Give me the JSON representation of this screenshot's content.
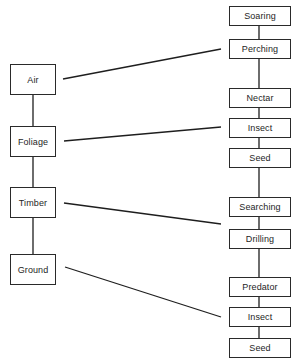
{
  "diagram": {
    "colors": {
      "line": "#1e1e1e",
      "box_border": "#2a2a2a",
      "background": "#ffffff"
    },
    "habitats": [
      {
        "label": "Air",
        "top": 64
      },
      {
        "label": "Foliage",
        "top": 126
      },
      {
        "label": "Timber",
        "top": 187
      },
      {
        "label": "Ground",
        "top": 254
      }
    ],
    "behaviours": [
      {
        "label": "Soaring",
        "top": 6
      },
      {
        "label": "Perching",
        "top": 39
      },
      {
        "label": "Nectar",
        "top": 88
      },
      {
        "label": "Insect",
        "top": 118
      },
      {
        "label": "Seed",
        "top": 148
      },
      {
        "label": "Searching",
        "top": 197
      },
      {
        "label": "Drilling",
        "top": 229
      },
      {
        "label": "Predator",
        "top": 277
      },
      {
        "label": "Insect",
        "top": 307
      },
      {
        "label": "Seed",
        "top": 338
      }
    ],
    "links": [
      {
        "from": "Air",
        "to": "Perching",
        "x1": 63,
        "y1": 79,
        "x2": 221,
        "y2": 49
      },
      {
        "from": "Foliage",
        "to": "Insect",
        "x1": 64,
        "y1": 141,
        "x2": 221,
        "y2": 127
      },
      {
        "from": "Timber",
        "to": "Drilling",
        "x1": 64,
        "y1": 203,
        "x2": 221,
        "y2": 224
      },
      {
        "from": "Ground",
        "to": "Insect",
        "x1": 65,
        "y1": 267,
        "x2": 221,
        "y2": 317
      }
    ]
  }
}
